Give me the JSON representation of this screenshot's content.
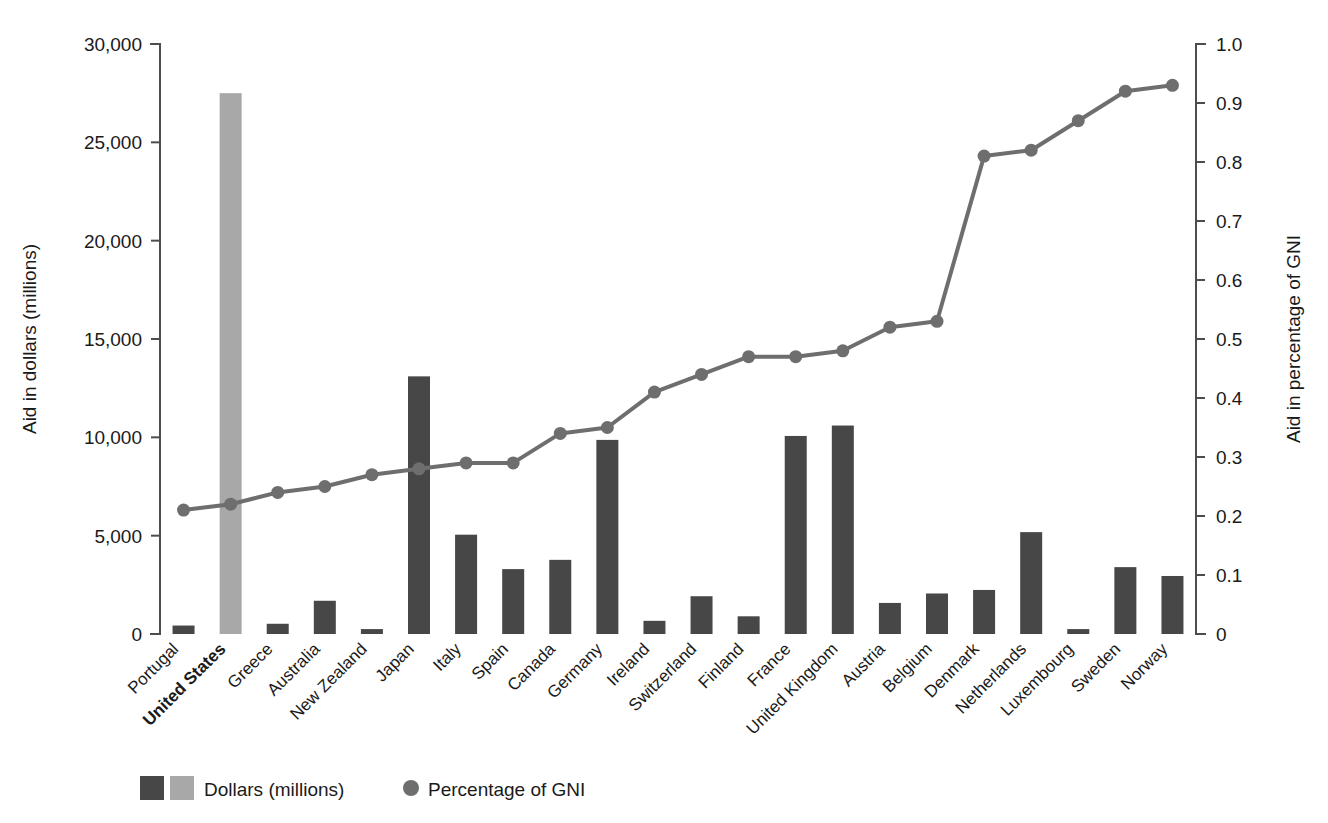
{
  "chart_data": {
    "type": "bar",
    "title": "",
    "subtitle": "",
    "categories": [
      "Portugal",
      "United States",
      "Greece",
      "Australia",
      "New Zealand",
      "Japan",
      "Italy",
      "Spain",
      "Canada",
      "Germany",
      "Ireland",
      "Switzerland",
      "Finland",
      "France",
      "United Kingdom",
      "Austria",
      "Belgium",
      "Denmark",
      "Netherlands",
      "Luxembourg",
      "Sweden",
      "Norway"
    ],
    "highlight_category": "United States",
    "series": [
      {
        "name": "Dollars (millions)",
        "type": "bar",
        "axis": "left",
        "color": "#474747",
        "highlight_color": "#a8a8a8",
        "values": [
          430,
          27500,
          520,
          1690,
          250,
          13100,
          5050,
          3300,
          3770,
          9870,
          670,
          1920,
          900,
          10070,
          10600,
          1580,
          2060,
          2240,
          5180,
          250,
          3400,
          2950
        ]
      },
      {
        "name": "Percentage of GNI",
        "type": "line",
        "axis": "right",
        "color": "#6e6e6e",
        "values": [
          0.21,
          0.22,
          0.24,
          0.25,
          0.27,
          0.28,
          0.29,
          0.29,
          0.34,
          0.35,
          0.41,
          0.44,
          0.47,
          0.47,
          0.48,
          0.52,
          0.53,
          0.81,
          0.82,
          0.87,
          0.92,
          0.93
        ]
      }
    ],
    "xlabel": "",
    "ylabel": "Aid in dollars (millions)",
    "y2label": "Aid in percentage of GNI",
    "ylim": [
      0,
      30000
    ],
    "y2lim": [
      0,
      1.0
    ],
    "yticks": [
      0,
      5000,
      10000,
      15000,
      20000,
      25000,
      30000
    ],
    "ytick_labels": [
      "0",
      "5,000",
      "10,000",
      "15,000",
      "20,000",
      "25,000",
      "30,000"
    ],
    "y2ticks": [
      0,
      0.1,
      0.2,
      0.3,
      0.4,
      0.5,
      0.6,
      0.7,
      0.8,
      0.9,
      1.0
    ],
    "y2tick_labels": [
      "0",
      "0.1",
      "0.2",
      "0.3",
      "0.4",
      "0.5",
      "0.6",
      "0.7",
      "0.8",
      "0.9",
      "1.0"
    ],
    "grid": false,
    "legend_position": "bottom-left",
    "legend": [
      {
        "label": "Dollars (millions)",
        "swatches": [
          "#474747",
          "#a8a8a8"
        ],
        "marker": "square"
      },
      {
        "label": "Percentage of GNI",
        "swatches": [
          "#6e6e6e"
        ],
        "marker": "circle"
      }
    ]
  },
  "colors": {
    "bar_dark": "#474747",
    "bar_light": "#a8a8a8",
    "line": "#6e6e6e",
    "axis": "#4d4d4d",
    "text": "#1a1a1a",
    "background": "#ffffff"
  }
}
